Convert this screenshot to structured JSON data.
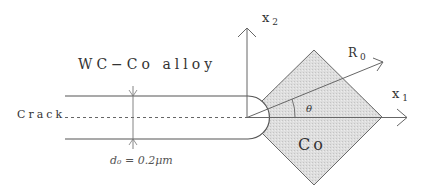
{
  "figure": {
    "material_label": "WC−Co alloy",
    "crack_label": "Crack",
    "crack_width_label": "d₀ = 0.2μm",
    "inclusion_label": "Co",
    "axis_x2": {
      "base": "x",
      "subscript": "2"
    },
    "axis_x1": {
      "base": "x",
      "subscript": "1"
    },
    "radius": {
      "base": "R",
      "subscript": "0"
    },
    "angle_label": "θ"
  },
  "colors": {
    "line": "#555555",
    "inclusion_fill": "#d9d9d9",
    "text": "#333333"
  }
}
